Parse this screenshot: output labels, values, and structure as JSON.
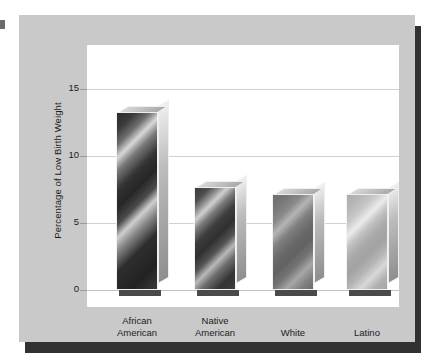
{
  "chart_data": {
    "type": "bar",
    "title": "",
    "xlabel": "",
    "ylabel": "Percentage of Low Birth Weight",
    "categories": [
      "African American",
      "Native American",
      "White",
      "Latino"
    ],
    "values": [
      13.3,
      7.7,
      7.2,
      7.2
    ],
    "yticks": [
      0,
      5,
      10,
      15
    ],
    "ytick_labels": [
      "0",
      "5",
      "10",
      "15"
    ],
    "ylim": [
      0,
      16.5
    ],
    "grid": true,
    "legend": "none",
    "style": "3d-metallic-bars"
  },
  "axis": {
    "y_title": "Percentage of Low Birth Weight",
    "ticks": [
      {
        "label": "15",
        "value": 15
      },
      {
        "label": "10",
        "value": 10
      },
      {
        "label": "5",
        "value": 5
      },
      {
        "label": "0",
        "value": 0
      }
    ]
  },
  "bars": [
    {
      "label_line1": "African",
      "label_line2": "American",
      "value": 13.3,
      "shade": "fill-darkest"
    },
    {
      "label_line1": "Native",
      "label_line2": "American",
      "value": 7.7,
      "shade": "fill-dark"
    },
    {
      "label_line1": "White",
      "label_line2": "",
      "value": 7.2,
      "shade": "fill-medium"
    },
    {
      "label_line1": "Latino",
      "label_line2": "",
      "value": 7.2,
      "shade": "fill-light"
    }
  ],
  "colors": {
    "panel_background": "#c9c9c9",
    "plot_background": "#ffffff",
    "gridline": "#d2d2d2",
    "shadow": "#33312f",
    "text": "#1c1c1c"
  }
}
